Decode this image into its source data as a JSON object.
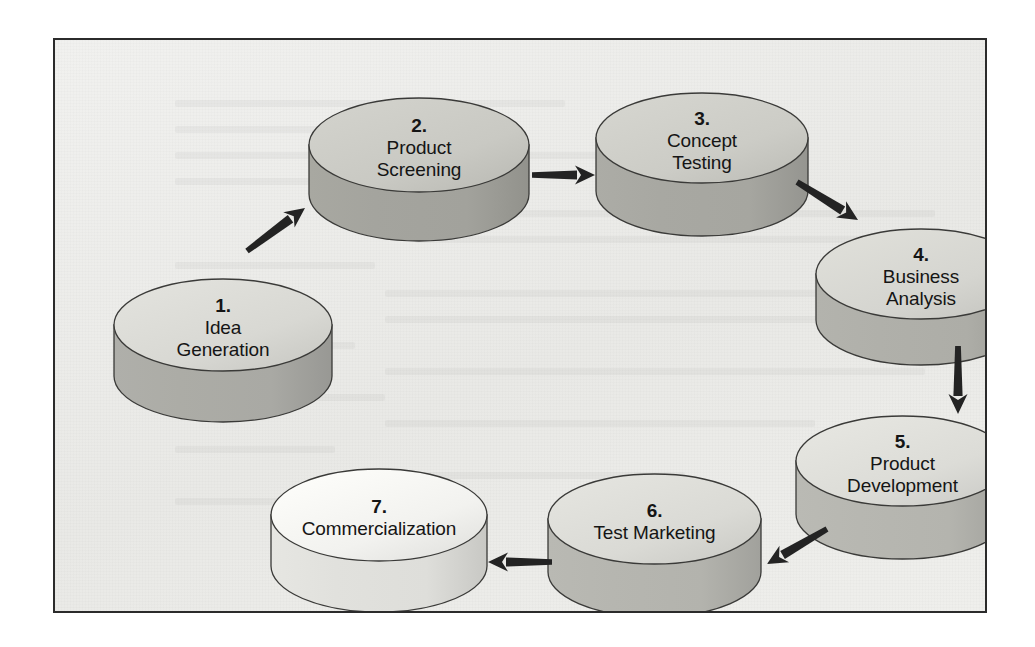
{
  "diagram": {
    "type": "cycle-flow",
    "shape": "cylinder",
    "frame": {
      "background_color": "#eeeeec",
      "border_color": "#2b2b2b"
    },
    "stages": [
      {
        "number": "1.",
        "line1": "Idea",
        "line2": "Generation",
        "top_color": "#d8d8d3",
        "body_color": "#a9a9a4",
        "x": 58,
        "y": 238,
        "width": 220,
        "height": 145,
        "font_size": 19
      },
      {
        "number": "2.",
        "line1": "Product",
        "line2": "Screening",
        "top_color": "#c9c9c3",
        "body_color": "#a2a29c",
        "x": 253,
        "y": 57,
        "width": 222,
        "height": 145,
        "font_size": 19
      },
      {
        "number": "3.",
        "line1": "Concept",
        "line2": "Testing",
        "top_color": "#ccccc6",
        "body_color": "#a6a6a0",
        "x": 540,
        "y": 52,
        "width": 214,
        "height": 145,
        "font_size": 19
      },
      {
        "number": "4.",
        "line1": "Business",
        "line2": "Analysis",
        "top_color": "#d5d5d0",
        "body_color": "#adada7",
        "x": 760,
        "y": 188,
        "width": 212,
        "height": 138,
        "font_size": 19
      },
      {
        "number": "5.",
        "line1": "Product",
        "line2": "Development",
        "top_color": "#dcdcd7",
        "body_color": "#b4b4ae",
        "x": 740,
        "y": 375,
        "width": 215,
        "height": 145,
        "font_size": 19
      },
      {
        "number": "6.",
        "line1": "Test Marketing",
        "line2": "",
        "top_color": "#dadad5",
        "body_color": "#b3b3ad",
        "x": 492,
        "y": 433,
        "width": 215,
        "height": 145,
        "font_size": 19
      },
      {
        "number": "7.",
        "line1": "Commercialization",
        "line2": "",
        "top_color": "#f2f2ef",
        "body_color": "#dededa",
        "x": 215,
        "y": 428,
        "width": 218,
        "height": 145,
        "font_size": 19
      }
    ],
    "arrows": [
      {
        "from": "1",
        "to": "2",
        "direction": "up-right",
        "x1": 192,
        "y1": 211,
        "x2": 250,
        "y2": 168
      },
      {
        "from": "2",
        "to": "3",
        "direction": "right",
        "x1": 477,
        "y1": 135,
        "x2": 540,
        "y2": 135
      },
      {
        "from": "3",
        "to": "4",
        "direction": "down-right",
        "x1": 742,
        "y1": 142,
        "x2": 803,
        "y2": 180
      },
      {
        "from": "4",
        "to": "5",
        "direction": "down",
        "x1": 903,
        "y1": 306,
        "x2": 903,
        "y2": 374
      },
      {
        "from": "5",
        "to": "6",
        "direction": "down-left",
        "x1": 772,
        "y1": 489,
        "x2": 712,
        "y2": 524
      },
      {
        "from": "6",
        "to": "7",
        "direction": "left",
        "x1": 497,
        "y1": 522,
        "x2": 433,
        "y2": 522
      }
    ]
  }
}
